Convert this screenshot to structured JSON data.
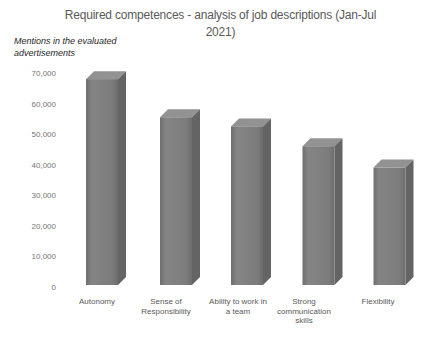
{
  "chart_data": {
    "type": "bar",
    "style": "3d-column",
    "title": "Required competences - analysis of job descriptions (Jan-Jul 2021)",
    "title_lines": [
      "Required competences - analysis of job descriptions (Jan-Jul",
      "2021)"
    ],
    "ylabel": "Mentions in the evaluated advertisements",
    "ylabel_lines": [
      "Mentions in the evaluated",
      "advertisements"
    ],
    "xlabel": "",
    "categories": [
      "Autonomy",
      "Sense of Responsibility",
      "Ability to work in a team",
      "Strong communication skills",
      "Flexibility"
    ],
    "category_lines": [
      [
        "Autonomy"
      ],
      [
        "Sense of",
        "Responsibility"
      ],
      [
        "Ability to work in",
        "a team"
      ],
      [
        "Strong",
        "communication",
        "skills"
      ],
      [
        "Flexibility"
      ]
    ],
    "values": [
      67500,
      55000,
      52000,
      45500,
      38500
    ],
    "ylim": [
      0,
      70000
    ],
    "ytick_step": 10000,
    "ytick_labels": [
      "0",
      "10,000",
      "20,000",
      "30,000",
      "40,000",
      "50,000",
      "60,000",
      "70,000"
    ],
    "grid": false,
    "legend": false,
    "colors": {
      "bar_front": "#7d7d7d",
      "bar_front_edge": "#6e6e6e",
      "bar_top": "#929292",
      "bar_side": "#646464",
      "title_text": "#595959",
      "axis_text": "#757575",
      "category_text": "#595959",
      "ylabel_text": "#262626",
      "background": "#ffffff"
    }
  }
}
